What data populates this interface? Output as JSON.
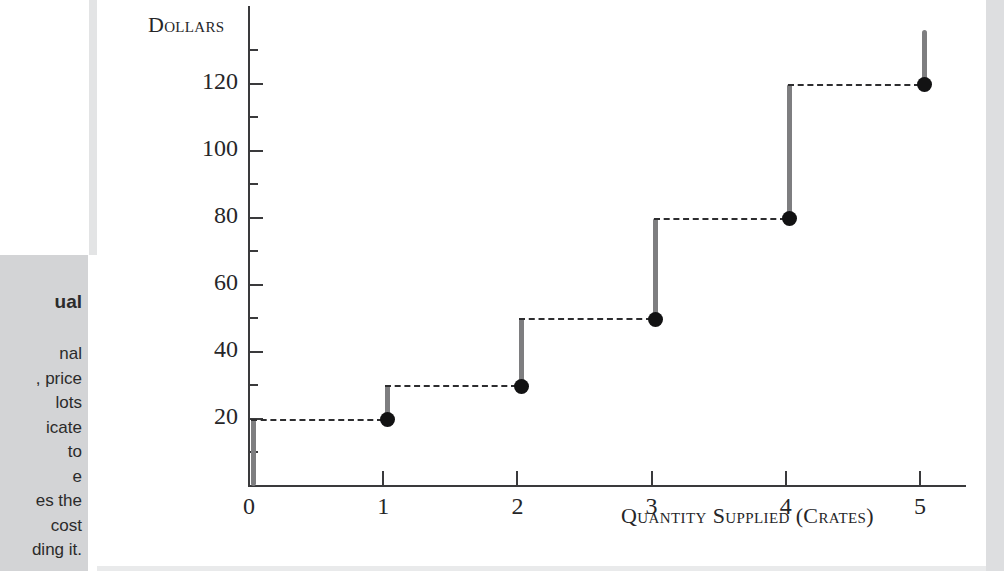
{
  "page": {
    "background_color": "#ffffff",
    "panel_gray": "#d3d4d6"
  },
  "sidebar_caption": {
    "heading_fragment": "ual",
    "line_fragments": [
      "nal",
      ", price",
      "lots",
      "icate",
      "to",
      "e",
      "es the",
      "cost",
      "ding it."
    ]
  },
  "chart_data": {
    "type": "line",
    "subtype": "step",
    "title": "",
    "xlabel": "Quantity Supplied (Crates)",
    "ylabel": "Dollars",
    "xlim": [
      0,
      5.4
    ],
    "ylim": [
      0,
      136
    ],
    "grid": false,
    "legend": null,
    "x_ticks": [
      "0",
      "1",
      "2",
      "3",
      "4",
      "5"
    ],
    "x_tick_values": [
      0,
      1,
      2,
      3,
      4,
      5
    ],
    "y_ticks": [
      "20",
      "40",
      "60",
      "80",
      "100",
      "120"
    ],
    "y_tick_values": [
      20,
      40,
      60,
      80,
      100,
      120
    ],
    "y_minor_tick_values": [
      10,
      30,
      50,
      70,
      90,
      110,
      130
    ],
    "x": [
      1,
      2,
      3,
      4,
      5
    ],
    "values": [
      20,
      30,
      50,
      80,
      120
    ],
    "points": [
      {
        "x": 1,
        "y": 20
      },
      {
        "x": 2,
        "y": 30
      },
      {
        "x": 3,
        "y": 50
      },
      {
        "x": 4,
        "y": 80
      },
      {
        "x": 5,
        "y": 120
      }
    ],
    "marker": "filled-circle",
    "marker_color": "#121213",
    "tread_style": "dashed",
    "tread_color": "#2d2d2f",
    "riser_color": "#7e7e80",
    "risers": [
      {
        "x": 0,
        "y_from": 0,
        "y_to": 20
      },
      {
        "x": 1,
        "y_from": 20,
        "y_to": 30
      },
      {
        "x": 2,
        "y_from": 30,
        "y_to": 50
      },
      {
        "x": 3,
        "y_from": 50,
        "y_to": 80
      },
      {
        "x": 4,
        "y_from": 80,
        "y_to": 120
      },
      {
        "x": 5,
        "y_from": 120,
        "y_to": 136
      }
    ],
    "treads": [
      {
        "y": 20,
        "x_from": 0,
        "x_to": 1
      },
      {
        "y": 30,
        "x_from": 1,
        "x_to": 2
      },
      {
        "y": 50,
        "x_from": 2,
        "x_to": 3
      },
      {
        "y": 80,
        "x_from": 3,
        "x_to": 4
      },
      {
        "y": 120,
        "x_from": 4,
        "x_to": 5
      }
    ]
  }
}
